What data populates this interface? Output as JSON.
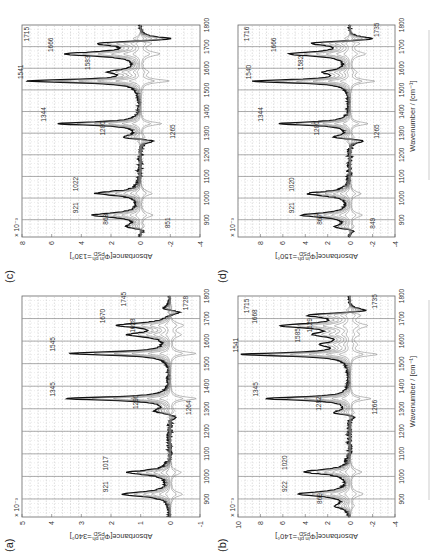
{
  "figure": {
    "x_axis_label": "Wavenumber / [cm⁻¹]",
    "scale_note": "× 10⁻³"
  },
  "chart_data": [
    {
      "panel": "(a)",
      "type": "line",
      "title": "",
      "xlabel": "Wavenumber / [cm⁻¹]",
      "ylabel": "Absorbance[Φ in ph.PSD=340°]",
      "ylabel_main": "Absorbance[Φ",
      "ylabel_sub": "PSD",
      "ylabel_sup": "in ph.",
      "ylabel_tail": "=340°]",
      "y_scale": "× 10⁻³",
      "xlim": [
        820,
        1800
      ],
      "ylim": [
        -1,
        5
      ],
      "xticks": [
        900,
        1000,
        1100,
        1200,
        1300,
        1400,
        1500,
        1600,
        1700,
        1800
      ],
      "yticks": [
        -1,
        0,
        1,
        2,
        3,
        4,
        5
      ],
      "grid": true,
      "vlines": [
        900,
        1000,
        1100,
        1200,
        1300,
        1400,
        1500,
        1600,
        1700
      ],
      "peaks_up": [
        [
          921,
          1.6
        ],
        [
          1017,
          1.4
        ],
        [
          1290,
          0.5
        ],
        [
          1345,
          3.5
        ],
        [
          1545,
          3.4
        ],
        [
          1628,
          1.3
        ],
        [
          1670,
          1.7
        ],
        [
          1745,
          0.3
        ]
      ],
      "peaks_down": [
        [
          1264,
          -0.3
        ],
        [
          1728,
          -0.5
        ]
      ],
      "annotations": [
        {
          "text": "921",
          "x": 921,
          "y": 2.1
        },
        {
          "text": "1017",
          "x": 1017,
          "y": 2.1
        },
        {
          "text": "1290",
          "x": 1290,
          "y": 1.1
        },
        {
          "text": "1264",
          "x": 1264,
          "y": -0.7
        },
        {
          "text": "1345",
          "x": 1345,
          "y": 3.9
        },
        {
          "text": "1545",
          "x": 1545,
          "y": 3.9
        },
        {
          "text": "1628",
          "x": 1628,
          "y": 1.2
        },
        {
          "text": "1670",
          "x": 1670,
          "y": 2.2
        },
        {
          "text": "1745",
          "x": 1745,
          "y": 1.5
        },
        {
          "text": "1728",
          "x": 1728,
          "y": -0.6
        }
      ]
    },
    {
      "panel": "(b)",
      "type": "line",
      "title": "",
      "xlabel": "Wavenumber / [cm⁻¹]",
      "ylabel": "Absorbance[Φ in ph.PSD=140°]",
      "ylabel_main": "Absorbance[Φ",
      "ylabel_sub": "PSD",
      "ylabel_sup": "in ph.",
      "ylabel_tail": "=140°]",
      "y_scale": "× 10⁻³",
      "xlim": [
        820,
        1800
      ],
      "ylim": [
        -4,
        10
      ],
      "xticks": [
        900,
        1000,
        1100,
        1200,
        1300,
        1400,
        1500,
        1600,
        1700,
        1800
      ],
      "yticks": [
        -4,
        -2,
        0,
        2,
        4,
        6,
        8,
        10
      ],
      "grid": true,
      "vlines": [
        900,
        1000,
        1100,
        1200,
        1300,
        1400,
        1500,
        1600,
        1700
      ],
      "peaks_up": [
        [
          869,
          1.2
        ],
        [
          922,
          4.5
        ],
        [
          1020,
          4.0
        ],
        [
          1282,
          1.6
        ],
        [
          1345,
          7.4
        ],
        [
          1541,
          9.5
        ],
        [
          1585,
          2.0
        ],
        [
          1629,
          2.6
        ],
        [
          1668,
          5.8
        ],
        [
          1715,
          4.0
        ]
      ],
      "peaks_down": [
        [
          1266,
          -1.0
        ],
        [
          1735,
          -2.6
        ]
      ],
      "annotations": [
        {
          "text": "869",
          "x": 869,
          "y": 2.5
        },
        {
          "text": "922",
          "x": 922,
          "y": 5.6
        },
        {
          "text": "1020",
          "x": 1020,
          "y": 5.6
        },
        {
          "text": "1282",
          "x": 1282,
          "y": 2.6
        },
        {
          "text": "1266",
          "x": 1266,
          "y": -2.4
        },
        {
          "text": "1345",
          "x": 1345,
          "y": 8.2
        },
        {
          "text": "1541",
          "x": 1541,
          "y": 10.0
        },
        {
          "text": "1585",
          "x": 1585,
          "y": 4.5
        },
        {
          "text": "1629",
          "x": 1629,
          "y": 3.4
        },
        {
          "text": "1668",
          "x": 1668,
          "y": 8.3
        },
        {
          "text": "1715",
          "x": 1715,
          "y": 9.0
        },
        {
          "text": "1735",
          "x": 1735,
          "y": -2.4
        }
      ]
    },
    {
      "panel": "(c)",
      "type": "line",
      "title": "",
      "xlabel": "",
      "ylabel": "Absorbance[Φ in ph.PSD=130°]",
      "ylabel_main": "Absorbance[Φ",
      "ylabel_sub": "PSD",
      "ylabel_sup": "in ph.",
      "ylabel_tail": "=130°]",
      "y_scale": "× 10⁻³",
      "xlim": [
        820,
        1800
      ],
      "ylim": [
        -4,
        8
      ],
      "xticks": [
        900,
        1000,
        1100,
        1200,
        1300,
        1400,
        1500,
        1600,
        1700,
        1800
      ],
      "yticks": [
        -4,
        -2,
        0,
        2,
        4,
        6,
        8
      ],
      "grid": true,
      "vlines": [
        900,
        1000,
        1100,
        1200,
        1300,
        1400,
        1500,
        1600,
        1700
      ],
      "peaks_up": [
        [
          868,
          1.0
        ],
        [
          921,
          3.2
        ],
        [
          1022,
          3.0
        ],
        [
          1280,
          1.6
        ],
        [
          1344,
          5.6
        ],
        [
          1541,
          7.5
        ],
        [
          1583,
          1.8
        ],
        [
          1666,
          5.0
        ],
        [
          1715,
          3.4
        ]
      ],
      "peaks_down": [
        [
          851,
          -0.6
        ],
        [
          1265,
          -1.5
        ],
        [
          1735,
          -3.0
        ]
      ],
      "annotations": [
        {
          "text": "868",
          "x": 868,
          "y": 2.2
        },
        {
          "text": "851",
          "x": 851,
          "y": -2.0
        },
        {
          "text": "921",
          "x": 921,
          "y": 4.2
        },
        {
          "text": "1022",
          "x": 1022,
          "y": 4.2
        },
        {
          "text": "1280",
          "x": 1280,
          "y": 2.4
        },
        {
          "text": "1265",
          "x": 1265,
          "y": -2.3
        },
        {
          "text": "1344",
          "x": 1344,
          "y": 6.4
        },
        {
          "text": "1541",
          "x": 1541,
          "y": 7.9
        },
        {
          "text": "1583",
          "x": 1583,
          "y": 3.4
        },
        {
          "text": "1666",
          "x": 1666,
          "y": 5.9
        },
        {
          "text": "1715",
          "x": 1715,
          "y": 7.5
        }
      ]
    },
    {
      "panel": "(d)",
      "type": "line",
      "title": "",
      "xlabel": "Wavenumber / [cm⁻¹]",
      "ylabel": "Absorbance[Φ in ph.PSD=150°]",
      "ylabel_main": "Absorbance[Φ",
      "ylabel_sub": "PSD",
      "ylabel_sup": "in ph.",
      "ylabel_tail": "=150°]",
      "y_scale": "× 10⁻³",
      "xlim": [
        820,
        1800
      ],
      "ylim": [
        -4,
        10
      ],
      "xticks": [
        900,
        1000,
        1100,
        1200,
        1300,
        1400,
        1500,
        1600,
        1700,
        1800
      ],
      "yticks": [
        -4,
        -2,
        0,
        2,
        4,
        6,
        8
      ],
      "grid": true,
      "vlines": [
        900,
        1000,
        1100,
        1200,
        1300,
        1400,
        1500,
        1600,
        1700
      ],
      "peaks_up": [
        [
          867,
          1.4
        ],
        [
          921,
          4.2
        ],
        [
          1020,
          3.8
        ],
        [
          1280,
          2.0
        ],
        [
          1344,
          6.3
        ],
        [
          1540,
          8.6
        ],
        [
          1582,
          2.0
        ],
        [
          1666,
          5.3
        ],
        [
          1716,
          4.0
        ]
      ],
      "peaks_down": [
        [
          849,
          -0.8
        ],
        [
          1265,
          -2.0
        ],
        [
          1735,
          -3.2
        ]
      ],
      "annotations": [
        {
          "text": "867",
          "x": 867,
          "y": 2.5
        },
        {
          "text": "849",
          "x": 849,
          "y": -2.2
        },
        {
          "text": "921",
          "x": 921,
          "y": 5.0
        },
        {
          "text": "1020",
          "x": 1020,
          "y": 5.0
        },
        {
          "text": "1280",
          "x": 1280,
          "y": 2.8
        },
        {
          "text": "1265",
          "x": 1265,
          "y": -2.6
        },
        {
          "text": "1344",
          "x": 1344,
          "y": 7.8
        },
        {
          "text": "1540",
          "x": 1540,
          "y": 8.8
        },
        {
          "text": "1582",
          "x": 1582,
          "y": 4.2
        },
        {
          "text": "1666",
          "x": 1666,
          "y": 6.6
        },
        {
          "text": "1716",
          "x": 1716,
          "y": 9.0
        },
        {
          "text": "1735",
          "x": 1735,
          "y": -2.6
        }
      ]
    }
  ]
}
